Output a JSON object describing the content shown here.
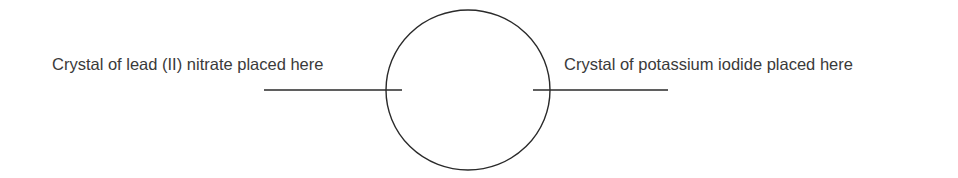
{
  "diagram": {
    "type": "experimental-setup",
    "labels": {
      "left": "Crystal of lead (II) nitrate placed here",
      "right": "Crystal of potassium iodide placed here"
    },
    "circle": {
      "cx": 468,
      "cy": 90,
      "rx": 82,
      "ry": 80
    },
    "pointers": {
      "left": {
        "x1": 264,
        "x2": 402,
        "y": 90
      },
      "right": {
        "x1": 533,
        "x2": 668,
        "y": 90
      }
    },
    "colors": {
      "stroke": "#2a2a2a",
      "text": "#3a3a3a",
      "background": "#ffffff"
    }
  }
}
